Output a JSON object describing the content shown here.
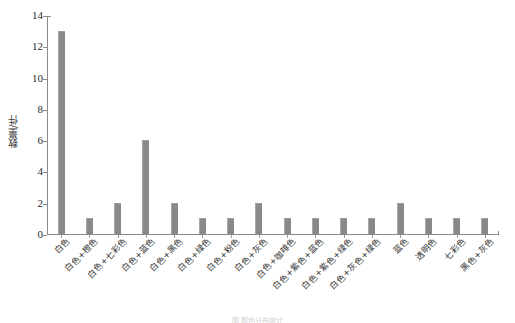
{
  "chart_data": {
    "type": "bar",
    "title": "",
    "xlabel": "",
    "ylabel": "数量/件",
    "ylim": [
      0,
      14
    ],
    "yticks": [
      0,
      2,
      4,
      6,
      8,
      10,
      12,
      14
    ],
    "grid": false,
    "legend": null,
    "bar_color": "#898989",
    "axis_color": "#8a8a8a",
    "categories": [
      "白色",
      "白色+橙色",
      "白色+七彩色",
      "白色+蓝色",
      "白色+黑色",
      "白色+绿色",
      "白色+粉色",
      "白色+灰色",
      "白色+咖啡色",
      "白色+紫色+蓝色",
      "白色+紫色+绿色",
      "白色+灰色+绿色",
      "蓝色",
      "透明色",
      "七彩色",
      "黑色+灰色"
    ],
    "values": [
      13,
      1,
      2,
      6,
      2,
      1,
      1,
      2,
      1,
      1,
      1,
      1,
      2,
      1,
      1,
      1
    ]
  },
  "caption": {
    "text": "图 颜色分布统计"
  }
}
